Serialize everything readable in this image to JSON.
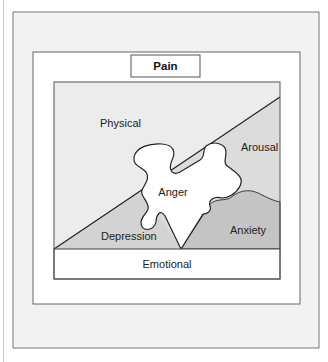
{
  "title": "Pain",
  "regions": {
    "physical": "Physical",
    "arousal": "Arousal",
    "anger": "Anger",
    "depression": "Depression",
    "anxiety": "Anxiety",
    "emotional": "Emotional"
  },
  "colors": {
    "outer_frame": "#f2f2f2",
    "inner_frame": "#ffffff",
    "physical": "#ececec",
    "arousal": "#dcdcdc",
    "depression": "#d3d3d3",
    "anxiety": "#c4c4c4",
    "anger": "#ffffff",
    "stroke": "#333333"
  }
}
